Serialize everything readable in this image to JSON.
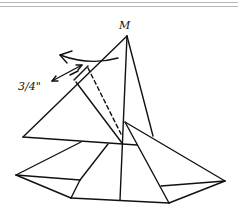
{
  "diagram": {
    "type": "folded-pyramid-sketch",
    "labels": {
      "apex": "M",
      "measurement": "3/4\""
    },
    "colors": {
      "stroke": "#111111",
      "rule": "#b8b8b8",
      "background": "#ffffff"
    }
  }
}
